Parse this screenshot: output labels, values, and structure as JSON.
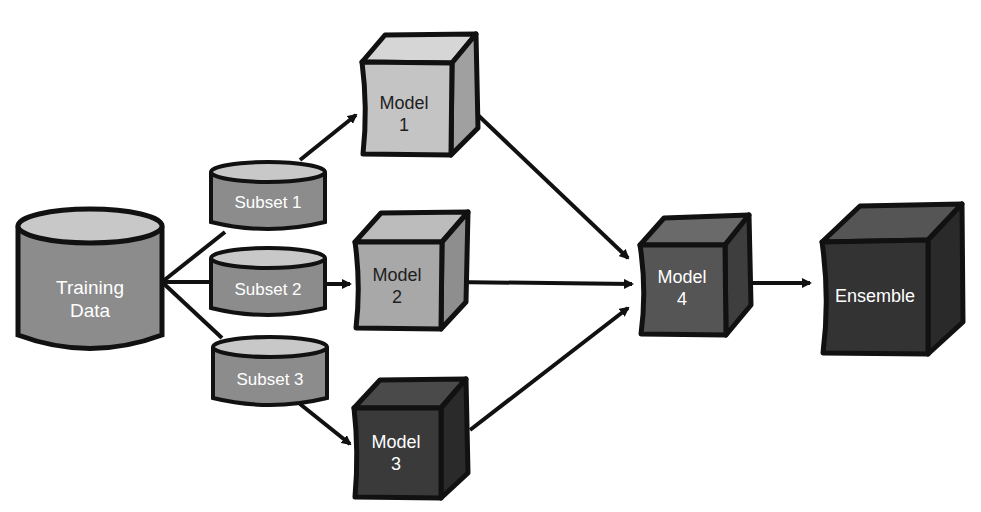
{
  "diagram": {
    "nodes": {
      "training_data": {
        "line1": "Training",
        "line2": "Data"
      },
      "subset1": {
        "label": "Subset 1"
      },
      "subset2": {
        "label": "Subset 2"
      },
      "subset3": {
        "label": "Subset 3"
      },
      "model1": {
        "line1": "Model",
        "line2": "1"
      },
      "model2": {
        "line1": "Model",
        "line2": "2"
      },
      "model3": {
        "line1": "Model",
        "line2": "3"
      },
      "model4": {
        "line1": "Model",
        "line2": "4"
      },
      "ensemble": {
        "label": "Ensemble"
      }
    },
    "edges": [
      [
        "training_data",
        "subset1"
      ],
      [
        "training_data",
        "subset2"
      ],
      [
        "training_data",
        "subset3"
      ],
      [
        "subset1",
        "model1"
      ],
      [
        "subset2",
        "model2"
      ],
      [
        "subset3",
        "model3"
      ],
      [
        "model1",
        "model4"
      ],
      [
        "model2",
        "model4"
      ],
      [
        "model3",
        "model4"
      ],
      [
        "model4",
        "ensemble"
      ]
    ],
    "colors": {
      "cylinder_fill": "#8c8c8c",
      "cylinder_top": "#c8c8c8",
      "light_cube": "#c4c4c4",
      "mid_cube": "#a8a8a8",
      "dark_cube": "#3a3a3a",
      "darker_cube": "#2a2a2a",
      "stroke": "#111111"
    }
  }
}
